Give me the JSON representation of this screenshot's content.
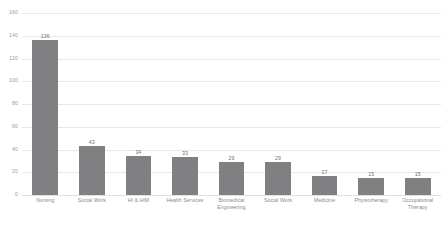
{
  "chart_data": {
    "type": "bar",
    "title": "",
    "xlabel": "",
    "ylabel": "",
    "ylim": [
      0,
      160
    ],
    "yticks": [
      0,
      20,
      40,
      60,
      80,
      100,
      120,
      140,
      160
    ],
    "grid": true,
    "legend": "none",
    "bar_color": "#808083",
    "categories": [
      "Nursing",
      "Social Work",
      "HI & HIM",
      "Health Services",
      "Biomedical Engineering",
      "Social Work",
      "Medicine",
      "Physiotherapy",
      "Occupational Therapy"
    ],
    "category_lines": [
      [
        "Nursing"
      ],
      [
        "Social Work"
      ],
      [
        "HI & HIM"
      ],
      [
        "Health Services"
      ],
      [
        "Biomedical",
        "Engineering"
      ],
      [
        "Social Work"
      ],
      [
        "Medicine"
      ],
      [
        "Physiotherapy"
      ],
      [
        "Occupational",
        "Therapy"
      ]
    ],
    "values": [
      136,
      43,
      34,
      33,
      29,
      29,
      17,
      15,
      15
    ],
    "value_labels": [
      "136",
      "43",
      "34",
      "33",
      "29",
      "29",
      "17",
      "15",
      "15"
    ]
  },
  "axis": {
    "ytick_labels": [
      "160",
      "140",
      "120",
      "100",
      "80",
      "60",
      "40",
      "20",
      "0"
    ]
  }
}
